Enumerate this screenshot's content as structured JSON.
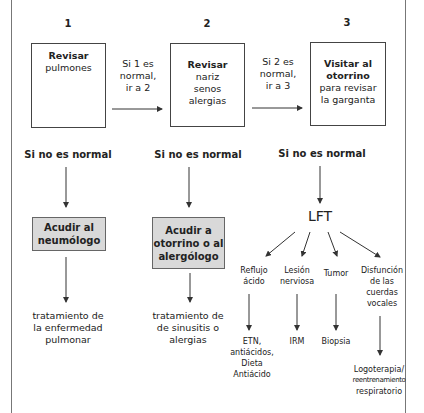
{
  "steps": [
    {
      "number": "1",
      "title": "Revisar",
      "body": "pulmones"
    },
    {
      "number": "2",
      "title": "Revisar",
      "body_lines": [
        "nariz",
        "senos",
        "alergias"
      ]
    },
    {
      "number": "3",
      "title_lines": [
        "Visitar al",
        "otorrino"
      ],
      "body_lines": [
        "para revisar",
        "la garganta"
      ]
    }
  ],
  "transitions": [
    {
      "lines": [
        "Si 1 es",
        "normal,",
        "ir a 2"
      ]
    },
    {
      "lines": [
        "Si 2 es",
        "normal,",
        "ir a 3"
      ]
    }
  ],
  "abnormal_label": "Si no es normal",
  "referrals": [
    {
      "lines": [
        "Acudir al",
        "neumólogo"
      ]
    },
    {
      "lines": [
        "Acudir a",
        "otorrino o al",
        "alergólogo"
      ]
    }
  ],
  "treatments": [
    {
      "lines": [
        "tratamiento de",
        "la enfermedad",
        "pulmonar"
      ]
    },
    {
      "lines": [
        "tratamiento de",
        "de sinusitis o",
        "alergias"
      ]
    }
  ],
  "lft": {
    "label": "LFT",
    "branches": [
      {
        "diagnosis_lines": [
          "Reflujo",
          "ácido"
        ],
        "treatment_lines": [
          "ETN,",
          "antiácidos,",
          "Dieta",
          "Antiácido"
        ]
      },
      {
        "diagnosis_lines": [
          "Lesión",
          "nerviosa"
        ],
        "treatment_lines": [
          "IRM"
        ]
      },
      {
        "diagnosis_lines": [
          "Tumor"
        ],
        "treatment_lines": [
          "Biopsia"
        ]
      },
      {
        "diagnosis_lines": [
          "Disfunción",
          "de las",
          "cuerdas",
          "vocales"
        ],
        "treatment_lines": [
          "Logoterapia/",
          "reentrenamiento",
          "respiratorio"
        ]
      }
    ]
  },
  "colors": {
    "referral_fill": "#d9d9d9",
    "line": "#333333"
  }
}
